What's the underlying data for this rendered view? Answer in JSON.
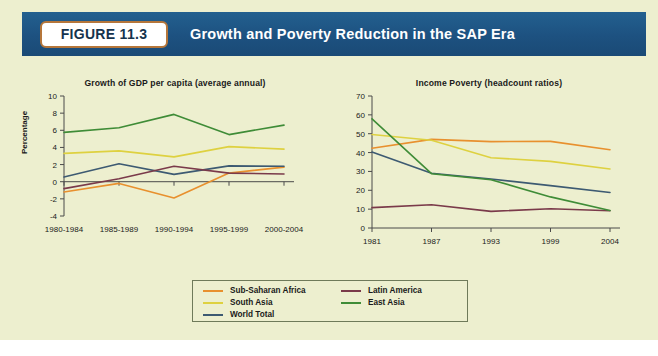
{
  "figure": {
    "badge_label": "FIGURE 11.3",
    "banner_title": "Growth and Poverty Reduction in the SAP Era",
    "banner_color": "#1e5480",
    "badge_border_color": "#b5763a",
    "page_background": "#edefcf"
  },
  "legend": {
    "column_1": [
      {
        "label": "Sub-Saharan Africa",
        "color": "#e8902e"
      },
      {
        "label": "South Asia",
        "color": "#e8d council"
      },
      {
        "label": "World Total",
        "color": "#3d5a72"
      }
    ],
    "column_2": [
      {
        "label": "Latin America",
        "color": "#7a3a4a"
      },
      {
        "label": "East Asia",
        "color": "#3f8c37"
      }
    ]
  },
  "series_colors": {
    "Sub-Saharan Africa": "#e8902e",
    "South Asia": "#ded140",
    "World Total": "#3d5a72",
    "Latin America": "#7a3a4a",
    "East Asia": "#3f8c37"
  },
  "chart_data": [
    {
      "type": "line",
      "id": "growth",
      "title": "Growth of GDP per capita (average annual)",
      "xlabel": "",
      "ylabel": "Percentage",
      "categories": [
        "1980-1984",
        "1985-1989",
        "1990-1994",
        "1995-1999",
        "2000-2004"
      ],
      "ylim": [
        -4,
        10
      ],
      "yticks": [
        -4,
        -2,
        0,
        2,
        4,
        6,
        8,
        10
      ],
      "grid": false,
      "legend_position": "below",
      "series": [
        {
          "name": "Sub-Saharan Africa",
          "color": "#e8902e",
          "values": [
            -1.2,
            -0.2,
            -1.9,
            1.0,
            1.7
          ]
        },
        {
          "name": "South Asia",
          "color": "#ded140",
          "values": [
            3.3,
            3.6,
            2.9,
            4.1,
            3.8
          ]
        },
        {
          "name": "World Total",
          "color": "#3d5a72",
          "values": [
            0.55,
            2.1,
            0.85,
            1.85,
            1.8
          ]
        },
        {
          "name": "Latin America",
          "color": "#7a3a4a",
          "values": [
            -0.8,
            0.35,
            1.8,
            1.0,
            0.9
          ]
        },
        {
          "name": "East Asia",
          "color": "#3f8c37",
          "values": [
            5.75,
            6.3,
            7.85,
            5.5,
            6.6
          ]
        }
      ]
    },
    {
      "type": "line",
      "id": "poverty",
      "title": "Income Poverty (headcount ratios)",
      "xlabel": "",
      "ylabel": "",
      "categories": [
        "1981",
        "1987",
        "1993",
        "1999",
        "2004"
      ],
      "ylim": [
        0,
        70
      ],
      "yticks": [
        0,
        10,
        20,
        30,
        40,
        50,
        60,
        70
      ],
      "grid": false,
      "legend_position": "below",
      "series": [
        {
          "name": "Sub-Saharan Africa",
          "color": "#e8902e",
          "values": [
            42.3,
            47.0,
            45.8,
            45.9,
            41.5
          ]
        },
        {
          "name": "South Asia",
          "color": "#ded140",
          "values": [
            49.6,
            46.5,
            37.3,
            35.3,
            31.3
          ]
        },
        {
          "name": "World Total",
          "color": "#3d5a72",
          "values": [
            40.3,
            29.0,
            26.0,
            22.5,
            18.8
          ]
        },
        {
          "name": "Latin America",
          "color": "#7a3a4a",
          "values": [
            10.8,
            12.3,
            8.8,
            10.2,
            9.1
          ]
        },
        {
          "name": "East Asia",
          "color": "#3f8c37",
          "values": [
            57.9,
            28.8,
            25.6,
            16.5,
            9.3
          ]
        }
      ]
    }
  ]
}
